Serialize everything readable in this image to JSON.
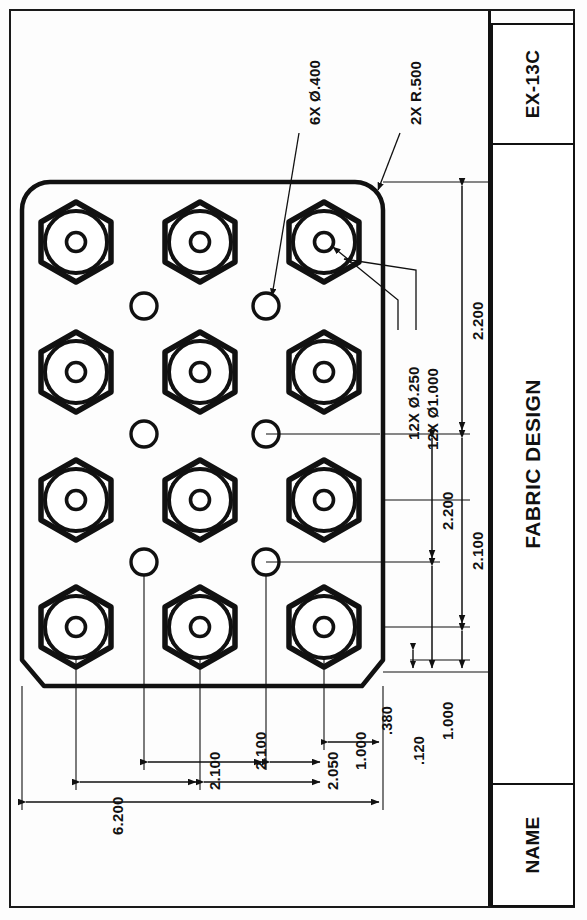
{
  "sheet": {
    "orientation": "rotated-90",
    "background": "#fdfdfd",
    "line_color": "#111111"
  },
  "title_block": {
    "name_label": "NAME",
    "drawing_title": "FABRIC DESIGN",
    "revision": "EX-13C"
  },
  "notes": [
    {
      "id": "note-6x-d400",
      "text": "6X Ø.400",
      "qty": "6X",
      "feature": "Ø.400"
    },
    {
      "id": "note-2x-r500",
      "text": "2X R.500",
      "qty": "2X",
      "feature": "R.500"
    },
    {
      "id": "note-12x-d250",
      "text": "12X Ø.250",
      "qty": "12X",
      "feature": "Ø.250"
    },
    {
      "id": "note-12x-d1000",
      "text": "12X Ø1.000",
      "qty": "12X",
      "feature": "Ø1.000"
    }
  ],
  "dimensions": {
    "vertical_chain": [
      {
        "id": "dim-8600",
        "value": "8.600"
      },
      {
        "id": "dim-2200-outer",
        "value": "2.200"
      },
      {
        "id": "dim-2200-inner",
        "value": "2.200"
      },
      {
        "id": "dim-2100-right",
        "value": "2.100"
      },
      {
        "id": "dim-1000-right",
        "value": "1.000"
      }
    ],
    "horizontal_chain": [
      {
        "id": "dim-6200",
        "value": "6.200"
      },
      {
        "id": "dim-2100-a",
        "value": "2.100"
      },
      {
        "id": "dim-2100-b",
        "value": "2.100"
      },
      {
        "id": "dim-2050",
        "value": "2.050"
      },
      {
        "id": "dim-1000-bottom",
        "value": "1.000"
      },
      {
        "id": "dim-380",
        "value": ".380"
      },
      {
        "id": "dim-120",
        "value": ".120"
      }
    ]
  },
  "part": {
    "description": "rectangular plate with 12 hex features and 6 round holes",
    "hex_rows": 4,
    "hex_cols": 3,
    "hole_rows": 3,
    "hole_cols": 2,
    "corner_style_top": "rounded R.500",
    "corner_style_bottom": "chamfered"
  }
}
